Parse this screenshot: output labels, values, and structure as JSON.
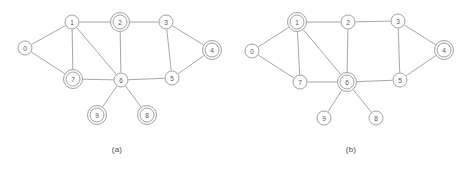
{
  "figure": {
    "background_color": "#ffffff",
    "stroke_color": "#909090",
    "label_color": "#555555"
  },
  "chart_data": {
    "type": "diagram",
    "title": "",
    "subtitle": "",
    "xlabel": "",
    "ylabel": "",
    "panels": [
      {
        "id": "a",
        "caption": "(a)",
        "node_radius": 7,
        "ring_radius": 9.5,
        "nodes": [
          {
            "id": "0",
            "label": "0",
            "x": 25,
            "y": 48,
            "double": false
          },
          {
            "id": "1",
            "label": "1",
            "x": 72,
            "y": 22,
            "double": false
          },
          {
            "id": "2",
            "label": "2",
            "x": 120,
            "y": 22,
            "double": true
          },
          {
            "id": "3",
            "label": "3",
            "x": 166,
            "y": 22,
            "double": false
          },
          {
            "id": "4",
            "label": "4",
            "x": 212,
            "y": 50,
            "double": true
          },
          {
            "id": "5",
            "label": "5",
            "x": 172,
            "y": 78,
            "double": false
          },
          {
            "id": "6",
            "label": "6",
            "x": 121,
            "y": 80,
            "double": false
          },
          {
            "id": "7",
            "label": "7",
            "x": 73,
            "y": 79,
            "double": true
          },
          {
            "id": "8",
            "label": "8",
            "x": 147,
            "y": 115,
            "double": true
          },
          {
            "id": "9",
            "label": "9",
            "x": 97,
            "y": 115,
            "double": true
          }
        ],
        "edges": [
          {
            "from": "0",
            "to": "1"
          },
          {
            "from": "0",
            "to": "7"
          },
          {
            "from": "1",
            "to": "2"
          },
          {
            "from": "1",
            "to": "7"
          },
          {
            "from": "1",
            "to": "6"
          },
          {
            "from": "2",
            "to": "3"
          },
          {
            "from": "2",
            "to": "6"
          },
          {
            "from": "3",
            "to": "4"
          },
          {
            "from": "3",
            "to": "5"
          },
          {
            "from": "4",
            "to": "5"
          },
          {
            "from": "5",
            "to": "6"
          },
          {
            "from": "6",
            "to": "7"
          },
          {
            "from": "6",
            "to": "8"
          },
          {
            "from": "6",
            "to": "9"
          }
        ],
        "marked_nodes": [
          "2",
          "4",
          "7",
          "8",
          "9"
        ]
      },
      {
        "id": "b",
        "caption": "(b)",
        "node_radius": 7,
        "ring_radius": 9.5,
        "nodes": [
          {
            "id": "0",
            "label": "0",
            "x": 18,
            "y": 51,
            "double": false
          },
          {
            "id": "1",
            "label": "1",
            "x": 63,
            "y": 22,
            "double": true
          },
          {
            "id": "2",
            "label": "2",
            "x": 114,
            "y": 22,
            "double": false
          },
          {
            "id": "3",
            "label": "3",
            "x": 164,
            "y": 21,
            "double": false
          },
          {
            "id": "4",
            "label": "4",
            "x": 210,
            "y": 50,
            "double": true
          },
          {
            "id": "5",
            "label": "5",
            "x": 166,
            "y": 80,
            "double": false
          },
          {
            "id": "6",
            "label": "6",
            "x": 113,
            "y": 82,
            "double": true
          },
          {
            "id": "7",
            "label": "7",
            "x": 66,
            "y": 82,
            "double": false
          },
          {
            "id": "8",
            "label": "8",
            "x": 142,
            "y": 118,
            "double": false
          },
          {
            "id": "9",
            "label": "9",
            "x": 90,
            "y": 118,
            "double": false
          }
        ],
        "edges": [
          {
            "from": "0",
            "to": "1"
          },
          {
            "from": "0",
            "to": "7"
          },
          {
            "from": "1",
            "to": "2"
          },
          {
            "from": "1",
            "to": "7"
          },
          {
            "from": "1",
            "to": "6"
          },
          {
            "from": "2",
            "to": "3"
          },
          {
            "from": "2",
            "to": "6"
          },
          {
            "from": "3",
            "to": "4"
          },
          {
            "from": "3",
            "to": "5"
          },
          {
            "from": "4",
            "to": "5"
          },
          {
            "from": "5",
            "to": "6"
          },
          {
            "from": "6",
            "to": "7"
          },
          {
            "from": "6",
            "to": "8"
          },
          {
            "from": "6",
            "to": "9"
          }
        ],
        "marked_nodes": [
          "1",
          "4",
          "6"
        ]
      }
    ]
  }
}
